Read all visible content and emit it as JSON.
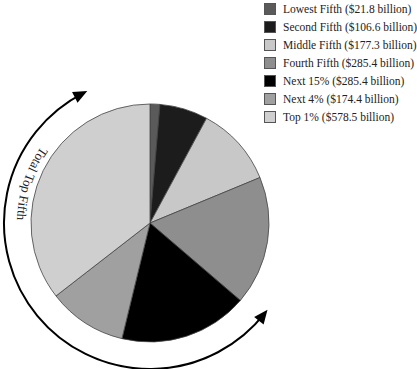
{
  "chart_data": {
    "type": "pie",
    "title": "",
    "categories": [
      "Lowest Fifth",
      "Second Fifth",
      "Middle Fifth",
      "Fourth Fifth",
      "Next 15%",
      "Next 4%",
      "Top 1%"
    ],
    "values": [
      21.8,
      106.6,
      177.3,
      285.4,
      285.4,
      174.4,
      578.5
    ],
    "units": "billion dollars",
    "colors": [
      "#5a5a5a",
      "#1c1c1c",
      "#c8c8c8",
      "#8e8e8e",
      "#000000",
      "#a0a0a0",
      "#cfcfcf"
    ],
    "start_angle": "12 o'clock, clockwise",
    "legend_position": "top-right",
    "annotation": "Total Top Fifth"
  },
  "legend": {
    "items": [
      {
        "label": "Lowest Fifth ($21.8 billion)",
        "color": "#5a5a5a"
      },
      {
        "label": "Second Fifth ($106.6 billion)",
        "color": "#1c1c1c"
      },
      {
        "label": "Middle Fifth ($177.3 billion)",
        "color": "#c8c8c8"
      },
      {
        "label": "Fourth Fifth ($285.4 billion)",
        "color": "#8e8e8e"
      },
      {
        "label": "Next 15% ($285.4 billion)",
        "color": "#000000"
      },
      {
        "label": "Next 4% ($174.4 billion)",
        "color": "#a0a0a0"
      },
      {
        "label": "Top 1% ($578.5 billion)",
        "color": "#cfcfcf"
      }
    ]
  },
  "annotation": {
    "text": "Total Top Fifth"
  }
}
